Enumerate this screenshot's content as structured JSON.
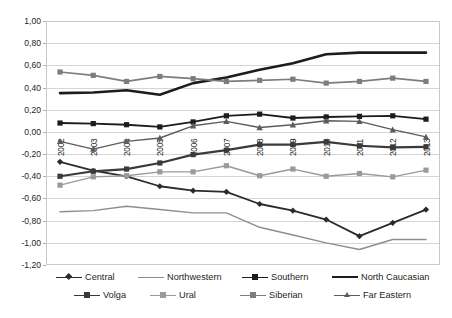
{
  "chart_data": {
    "type": "line",
    "title": "",
    "xlabel": "",
    "ylabel": "",
    "ylim": [
      -1.2,
      1.0
    ],
    "ytick_step": 0.2,
    "grid": true,
    "legend_position": "bottom",
    "decimal_separator": ",",
    "categories": [
      "2002",
      "2003",
      "2004",
      "2005",
      "2006",
      "2007",
      "2008",
      "2009",
      "2010",
      "2011",
      "2012",
      "2013"
    ],
    "ytick_labels": [
      "1,00",
      "0,80",
      "0,60",
      "0,40",
      "0,20",
      "0,00",
      "-0,20",
      "-0,40",
      "-0,60",
      "-0,80",
      "-1,00",
      "-1,20"
    ],
    "ytick_values": [
      1.0,
      0.8,
      0.6,
      0.4,
      0.2,
      0.0,
      -0.2,
      -0.4,
      -0.6,
      -0.8,
      -1.0,
      -1.2
    ],
    "series": [
      {
        "name": "Central",
        "marker": "diamond",
        "color": "#2b2b2b",
        "width": 1.8,
        "values": [
          -0.27,
          -0.35,
          -0.4,
          -0.49,
          -0.53,
          -0.54,
          -0.65,
          -0.71,
          -0.79,
          -0.94,
          -0.82,
          -0.7
        ]
      },
      {
        "name": "Northwestern",
        "marker": "none",
        "color": "#8d8d8d",
        "width": 1.4,
        "values": [
          -0.72,
          -0.71,
          -0.67,
          -0.7,
          -0.73,
          -0.73,
          -0.86,
          -0.93,
          -1.0,
          -1.06,
          -0.97,
          -0.97
        ]
      },
      {
        "name": "Southern",
        "marker": "square",
        "color": "#1c1c1c",
        "width": 1.9,
        "values": [
          0.08,
          0.075,
          0.065,
          0.045,
          0.09,
          0.145,
          0.16,
          0.125,
          0.135,
          0.14,
          0.145,
          0.115
        ]
      },
      {
        "name": "North Caucasian",
        "marker": "none",
        "color": "#1c1c1c",
        "width": 2.6,
        "values": [
          0.35,
          0.355,
          0.375,
          0.335,
          0.44,
          0.49,
          0.56,
          0.62,
          0.7,
          0.715,
          0.715,
          0.715
        ]
      },
      {
        "name": "Volga",
        "marker": "square",
        "color": "#3a3a3a",
        "width": 2.2,
        "values": [
          -0.4,
          -0.355,
          -0.335,
          -0.28,
          -0.205,
          -0.165,
          -0.115,
          -0.115,
          -0.09,
          -0.125,
          -0.14,
          -0.135
        ]
      },
      {
        "name": "Ural",
        "marker": "square",
        "color": "#9a9a9a",
        "width": 1.4,
        "values": [
          -0.48,
          -0.405,
          -0.395,
          -0.36,
          -0.36,
          -0.305,
          -0.395,
          -0.335,
          -0.4,
          -0.375,
          -0.405,
          -0.345
        ]
      },
      {
        "name": "Siberian",
        "marker": "square",
        "color": "#7d7d7d",
        "width": 1.7,
        "values": [
          0.54,
          0.51,
          0.455,
          0.5,
          0.48,
          0.455,
          0.465,
          0.475,
          0.44,
          0.455,
          0.485,
          0.455
        ]
      },
      {
        "name": "Far Eastern",
        "marker": "triangle",
        "color": "#5c5c5c",
        "width": 1.4,
        "values": [
          -0.085,
          -0.155,
          -0.085,
          -0.055,
          0.055,
          0.095,
          0.04,
          0.065,
          0.1,
          0.095,
          0.02,
          -0.045
        ]
      }
    ]
  }
}
